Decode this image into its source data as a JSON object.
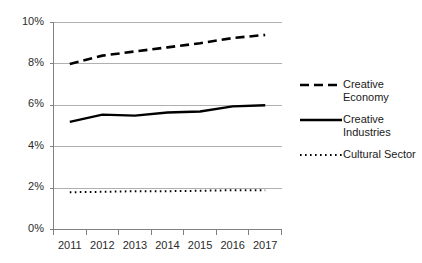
{
  "chart_data": {
    "type": "line",
    "title": "",
    "subtitle": "",
    "xlabel": "",
    "ylabel": "",
    "categories": [
      "2011",
      "2012",
      "2013",
      "2014",
      "2015",
      "2016",
      "2017"
    ],
    "x_tick_labels": [
      "2011",
      "2012",
      "2013",
      "2014",
      "2015",
      "2016",
      "2017"
    ],
    "y_tick_labels": [
      "0%",
      "2%",
      "4%",
      "6%",
      "8%",
      "10%"
    ],
    "y_tick_values": [
      0,
      2,
      4,
      6,
      8,
      10
    ],
    "ylim": [
      0,
      10
    ],
    "grid": "horizontal",
    "legend_position": "right",
    "value_suffix": "%",
    "series": [
      {
        "name": "Creative Economy",
        "legend_label": "Creative\nEconomy",
        "style": "dashed",
        "color": "#000000",
        "values": [
          8.0,
          8.4,
          8.6,
          8.8,
          9.0,
          9.25,
          9.4
        ]
      },
      {
        "name": "Creative Industries",
        "legend_label": "Creative\nIndustries",
        "style": "solid",
        "color": "#000000",
        "values": [
          5.2,
          5.55,
          5.5,
          5.65,
          5.7,
          5.95,
          6.0
        ]
      },
      {
        "name": "Cultural Sector",
        "legend_label": "Cultural Sector",
        "style": "dotted",
        "color": "#000000",
        "values": [
          1.8,
          1.82,
          1.85,
          1.85,
          1.87,
          1.9,
          1.9
        ]
      }
    ]
  },
  "colors": {
    "background": "#ffffff",
    "axis": "#808080",
    "gridline": "#b0b0b0",
    "series": "#000000",
    "tick_text": "#2b2b2b"
  }
}
